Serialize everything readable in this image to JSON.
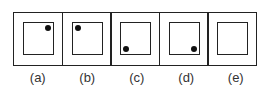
{
  "figures": [
    {
      "label": "(a)",
      "dot": "top-right"
    },
    {
      "label": "(b)",
      "dot": "top-left"
    },
    {
      "label": "(c)",
      "dot": "bottom-left"
    },
    {
      "label": "(d)",
      "dot": "bottom-right"
    },
    {
      "label": "(e)",
      "dot": "none"
    }
  ]
}
